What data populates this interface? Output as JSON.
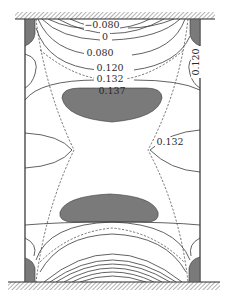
{
  "figure": {
    "type": "contour-plot",
    "colors": {
      "background": "#ffffff",
      "line": "#3a3a3a",
      "shaded_region": "#7a7a7a",
      "hatch": "#555555"
    },
    "boundaries": {
      "top": "fixed-wall-hatched",
      "bottom": "fixed-wall-hatched",
      "left": "free-edge",
      "right": "free-edge"
    },
    "contour_labels": [
      {
        "id": "c1",
        "text": "−0.080",
        "x": 102,
        "y": 28,
        "rotate": 0
      },
      {
        "id": "c2",
        "text": "0",
        "x": 105,
        "y": 40,
        "rotate": 0
      },
      {
        "id": "c3",
        "text": "0.080",
        "x": 100,
        "y": 56,
        "rotate": 0
      },
      {
        "id": "c4",
        "text": "0.120",
        "x": 110,
        "y": 71,
        "rotate": 0
      },
      {
        "id": "c5",
        "text": "0.132",
        "x": 110,
        "y": 82,
        "rotate": 0
      },
      {
        "id": "c6",
        "text": "0.137",
        "x": 112,
        "y": 94,
        "rotate": 0
      },
      {
        "id": "c7",
        "text": "0.120",
        "x": 196,
        "y": 62,
        "rotate": -90
      },
      {
        "id": "c8",
        "text": "0.132",
        "x": 170,
        "y": 145,
        "rotate": 0
      }
    ],
    "shaded_regions": [
      "upper-central-lobe",
      "lower-central-lobe",
      "top-left-corner",
      "top-right-corner",
      "bottom-left-corner",
      "bottom-right-corner"
    ]
  }
}
